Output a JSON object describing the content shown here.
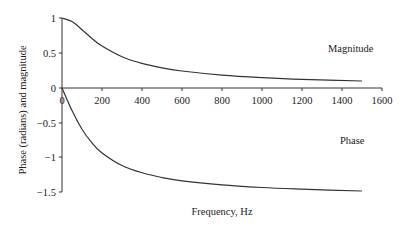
{
  "chart_data": {
    "type": "line",
    "title": "",
    "xlabel": "Frequency, Hz",
    "ylabel": "Phase (radians) and magnitude",
    "xlim": [
      0,
      1600
    ],
    "ylim": [
      -1.5,
      1
    ],
    "xticks": [
      0,
      200,
      400,
      600,
      800,
      1000,
      1200,
      1400,
      1600
    ],
    "xtick_labels": [
      "0",
      "200",
      "400",
      "600",
      "800",
      "1000",
      "1200",
      "1400",
      "1600"
    ],
    "yticks": [
      1,
      0.5,
      0,
      -0.5,
      -1,
      -1.5
    ],
    "ytick_labels": [
      "1",
      "0.5",
      "0",
      "−0.5",
      "−1",
      "−1.5"
    ],
    "grid": false,
    "legend": "none (inline annotations)",
    "annotations": [
      {
        "text": "Magnitude",
        "x": 1330,
        "y": 0.34
      },
      {
        "text": "Phase",
        "x": 1390,
        "y": -0.28
      }
    ],
    "x": [
      0,
      50,
      100,
      150,
      200,
      300,
      400,
      500,
      600,
      800,
      1000,
      1200,
      1500
    ],
    "series": [
      {
        "name": "Magnitude",
        "values": [
          1.0,
          0.949,
          0.832,
          0.707,
          0.6,
          0.447,
          0.351,
          0.287,
          0.243,
          0.184,
          0.148,
          0.124,
          0.1
        ]
      },
      {
        "name": "Phase",
        "values": [
          0.0,
          -0.322,
          -0.588,
          -0.785,
          -0.927,
          -1.107,
          -1.212,
          -1.279,
          -1.326,
          -1.385,
          -1.422,
          -1.446,
          -1.471
        ]
      }
    ]
  },
  "labels": {
    "magnitude": "Magnitude",
    "phase": "Phase",
    "xlabel": "Frequency, Hz",
    "ylabel": "Phase (radians) and magnitude"
  },
  "ticks": {
    "x": [
      "0",
      "200",
      "400",
      "600",
      "800",
      "1000",
      "1200",
      "1400",
      "1600"
    ],
    "y": [
      "1",
      "0.5",
      "0",
      "−0.5",
      "−1",
      "−1.5"
    ]
  }
}
